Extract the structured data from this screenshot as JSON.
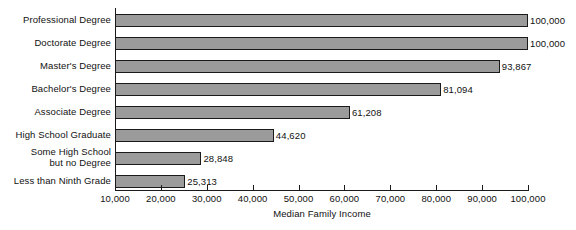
{
  "chart_data": {
    "type": "bar",
    "orientation": "horizontal",
    "title": "",
    "xlabel": "Median Family Income",
    "ylabel": "",
    "categories": [
      "Professional Degree",
      "Doctorate Degree",
      "Master's Degree",
      "Bachelor's Degree",
      "Associate Degree",
      "High School Graduate",
      "Some High School\nbut no Degree",
      "Less than Ninth Grade"
    ],
    "values": [
      100000,
      100000,
      93867,
      81094,
      61208,
      44620,
      28848,
      25313
    ],
    "value_labels": [
      "100,000",
      "100,000",
      "93,867",
      "81,094",
      "61,208",
      "44,620",
      "28,848",
      "25,313"
    ],
    "xlim": [
      10000,
      100000
    ],
    "xticks": [
      10000,
      20000,
      30000,
      40000,
      50000,
      60000,
      70000,
      80000,
      90000,
      100000
    ],
    "xtick_labels": [
      "10,000",
      "20,000",
      "30,000",
      "40,000",
      "50,000",
      "60,000",
      "70,000",
      "80,000",
      "90,000",
      "100,000"
    ],
    "grid": false,
    "legend": false,
    "bar_color": "#9b9b9b",
    "bar_edge_color": "#1a1a1a",
    "axis_color": "#1a1a1a",
    "background_color": "#ffffff",
    "text_color": "#111111"
  }
}
